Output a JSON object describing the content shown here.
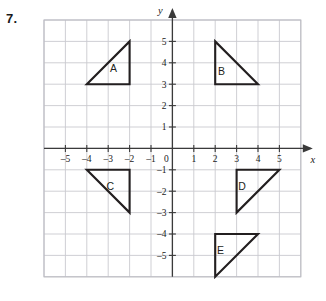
{
  "problem": {
    "number": "7."
  },
  "graph": {
    "x_axis_label": "x",
    "y_axis_label": "y",
    "origin_label": "0",
    "x_tick_labels": [
      "–5",
      "–4",
      "–3",
      "–2",
      "–1",
      "1",
      "2",
      "3",
      "4",
      "5"
    ],
    "y_tick_labels": [
      "5",
      "4",
      "3",
      "2",
      "1",
      "–1",
      "–2",
      "–3",
      "–4",
      "–5"
    ],
    "x_range": [
      -6,
      6
    ],
    "y_range": [
      -6,
      6
    ],
    "grid": true,
    "axis_color": "#3a3a3a",
    "grid_color": "#c9c9cf",
    "shape_color": "#231f20"
  },
  "chart_data": {
    "type": "scatter",
    "title": "",
    "xlabel": "x",
    "ylabel": "y",
    "xlim": [
      -6,
      6
    ],
    "ylim": [
      -6,
      6
    ],
    "grid": true,
    "shapes": [
      {
        "label": "A",
        "vertices": [
          [
            -4,
            3
          ],
          [
            -2,
            3
          ],
          [
            -2,
            5
          ]
        ],
        "right_angle_at": [
          -2,
          3
        ],
        "label_pos": [
          -2.75,
          3.75
        ]
      },
      {
        "label": "B",
        "vertices": [
          [
            2,
            5
          ],
          [
            2,
            3
          ],
          [
            4,
            3
          ]
        ],
        "right_angle_at": [
          2,
          3
        ],
        "label_pos": [
          2.3,
          3.6
        ]
      },
      {
        "label": "C",
        "vertices": [
          [
            -4,
            -1
          ],
          [
            -2,
            -1
          ],
          [
            -2,
            -3
          ]
        ],
        "right_angle_at": [
          -2,
          -1
        ],
        "label_pos": [
          -2.9,
          -1.75
        ]
      },
      {
        "label": "D",
        "vertices": [
          [
            3,
            -1
          ],
          [
            5,
            -1
          ],
          [
            3,
            -3
          ]
        ],
        "right_angle_at": [
          3,
          -1
        ],
        "label_pos": [
          3.25,
          -1.75
        ]
      },
      {
        "label": "E",
        "vertices": [
          [
            2,
            -4
          ],
          [
            4,
            -4
          ],
          [
            2,
            -6
          ]
        ],
        "right_angle_at": [
          2,
          -4
        ],
        "label_pos": [
          2.25,
          -4.75
        ]
      }
    ]
  }
}
